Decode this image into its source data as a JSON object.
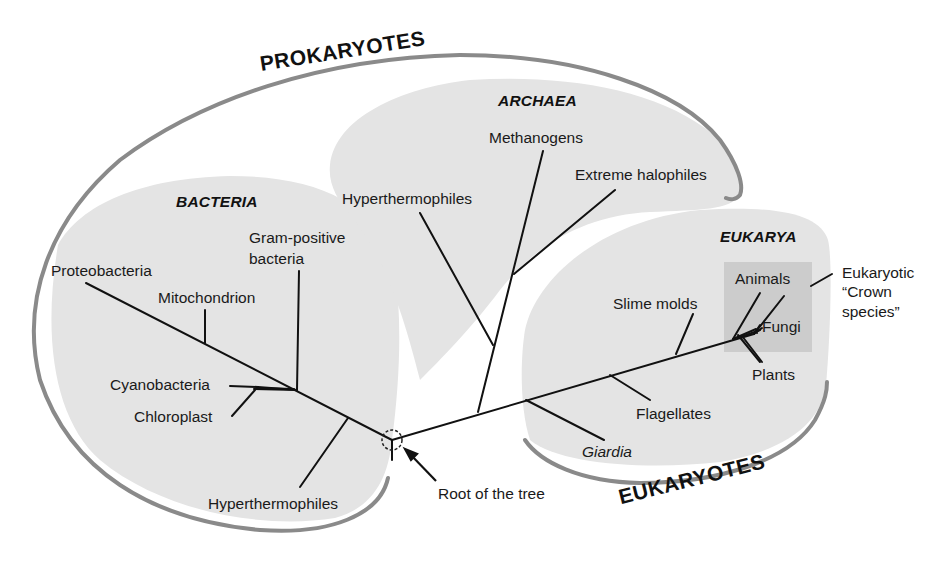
{
  "groups": {
    "prokaryotes": "PROKARYOTES",
    "eukaryotes": "EUKARYOTES"
  },
  "domains": {
    "bacteria": "BACTERIA",
    "archaea": "ARCHAEA",
    "eukarya": "EUKARYA"
  },
  "bacteria_taxa": {
    "proteobacteria": "Proteobacteria",
    "mitochondrion": "Mitochondrion",
    "gram_positive_1": "Gram-positive",
    "gram_positive_2": "bacteria",
    "cyanobacteria": "Cyanobacteria",
    "chloroplast": "Chloroplast",
    "hyperthermophiles": "Hyperthermophiles"
  },
  "archaea_taxa": {
    "hyperthermophiles": "Hyperthermophiles",
    "methanogens": "Methanogens",
    "extreme_halophiles": "Extreme halophiles"
  },
  "eukarya_taxa": {
    "slime_molds": "Slime molds",
    "animals": "Animals",
    "fungi": "Fungi",
    "plants": "Plants",
    "flagellates": "Flagellates",
    "giardia": "Giardia"
  },
  "annotations": {
    "crown_1": "Eukaryotic",
    "crown_2": "“Crown",
    "crown_3": "species”",
    "root": "Root of the tree"
  },
  "colors": {
    "region_fill": "#e3e3e3",
    "crown_box": "#cfcfcf",
    "arc_stroke": "#8a8a8a",
    "branch": "#111111"
  }
}
